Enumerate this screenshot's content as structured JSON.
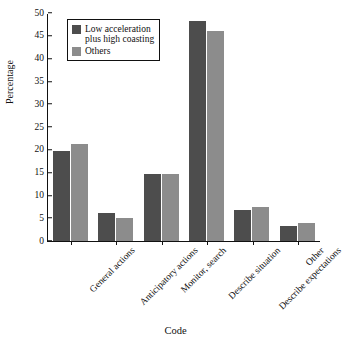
{
  "chart_data": {
    "type": "bar",
    "title": "",
    "xlabel": "Code",
    "ylabel": "Percentage",
    "ylim": [
      0,
      50
    ],
    "yticks": [
      0,
      5,
      10,
      15,
      20,
      25,
      30,
      35,
      40,
      45,
      50
    ],
    "grid": false,
    "legend_position": "top-left inside",
    "categories": [
      "General actions",
      "Anticipatory actions",
      "Monitor, search",
      "Describe situation",
      "Describe expectations",
      "Other"
    ],
    "series": [
      {
        "name": "Low acceleration\nplus high coasting",
        "color": "#4d4d4d",
        "values": [
          19.8,
          6.1,
          14.8,
          48.2,
          6.8,
          3.4
        ]
      },
      {
        "name": "Others",
        "color": "#8c8c8c",
        "values": [
          21.3,
          5.0,
          14.8,
          46.0,
          7.4,
          4.0
        ]
      }
    ]
  }
}
